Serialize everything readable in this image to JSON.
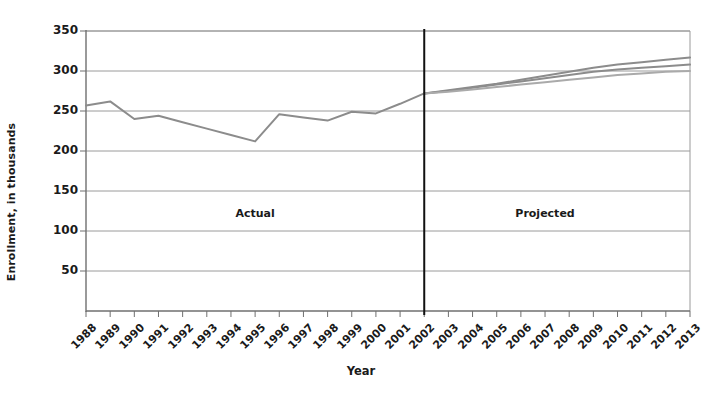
{
  "chart_data": {
    "type": "line",
    "title": "",
    "xlabel": "Year",
    "ylabel": "Enrollment, in thousands",
    "ylim": [
      0,
      350
    ],
    "yticks": [
      50,
      100,
      150,
      200,
      250,
      300,
      350
    ],
    "grid": true,
    "legend_position": "none",
    "categories": [
      "1988",
      "1989",
      "1990",
      "1991",
      "1992",
      "1993",
      "1994",
      "1995",
      "1996",
      "1997",
      "1998",
      "1999",
      "2000",
      "2001",
      "2002",
      "2003",
      "2004",
      "2005",
      "2006",
      "2007",
      "2008",
      "2009",
      "2010",
      "2011",
      "2012",
      "2013"
    ],
    "series": [
      {
        "name": "Actual",
        "color": "#8c8c8c",
        "x": [
          "1988",
          "1989",
          "1990",
          "1991",
          "1992",
          "1993",
          "1994",
          "1995",
          "1996",
          "1997",
          "1998",
          "1999",
          "2000",
          "2001",
          "2002"
        ],
        "values": [
          257,
          262,
          240,
          244,
          236,
          228,
          220,
          212,
          246,
          242,
          238,
          249,
          247,
          259,
          272
        ]
      },
      {
        "name": "Projected high",
        "color": "#8c8c8c",
        "x": [
          "2002",
          "2003",
          "2004",
          "2005",
          "2006",
          "2007",
          "2008",
          "2009",
          "2010",
          "2011",
          "2012",
          "2013"
        ],
        "values": [
          272,
          276,
          280,
          284,
          289,
          294,
          299,
          304,
          308,
          311,
          314,
          317
        ]
      },
      {
        "name": "Projected middle",
        "color": "#8c8c8c",
        "x": [
          "2002",
          "2003",
          "2004",
          "2005",
          "2006",
          "2007",
          "2008",
          "2009",
          "2010",
          "2011",
          "2012",
          "2013"
        ],
        "values": [
          272,
          275,
          279,
          283,
          287,
          291,
          295,
          299,
          302,
          304,
          306,
          308
        ]
      },
      {
        "name": "Projected low",
        "color": "#aaaaaa",
        "x": [
          "2002",
          "2003",
          "2004",
          "2005",
          "2006",
          "2007",
          "2008",
          "2009",
          "2010",
          "2011",
          "2012",
          "2013"
        ],
        "values": [
          272,
          274,
          277,
          280,
          283,
          286,
          289,
          292,
          295,
          297,
          299,
          300
        ]
      }
    ],
    "annotations": [
      {
        "text": "Actual",
        "x": "1995",
        "y": 120
      },
      {
        "text": "Projected",
        "x": "2007",
        "y": 120
      }
    ],
    "divider": {
      "x": "2002",
      "color": "#111111"
    }
  },
  "axes": {
    "y_label": "Enrollment, in thousands",
    "x_label": "Year",
    "y_ticks": [
      "350",
      "300",
      "250",
      "200",
      "150",
      "100",
      "50"
    ],
    "x_ticks": [
      "1988",
      "1989",
      "1990",
      "1991",
      "1992",
      "1993",
      "1994",
      "1995",
      "1996",
      "1997",
      "1998",
      "1999",
      "2000",
      "2001",
      "2002",
      "2003",
      "2004",
      "2005",
      "2006",
      "2007",
      "2008",
      "2009",
      "2010",
      "2011",
      "2012",
      "2013"
    ]
  },
  "regions": {
    "actual_label": "Actual",
    "projected_label": "Projected"
  },
  "colors": {
    "line": "#8c8c8c",
    "line_light": "#aaaaaa",
    "grid": "#9a9a9a",
    "axis": "#6f6f6f",
    "divider": "#111111",
    "text": "#1a1a1a",
    "background": "#ffffff"
  }
}
